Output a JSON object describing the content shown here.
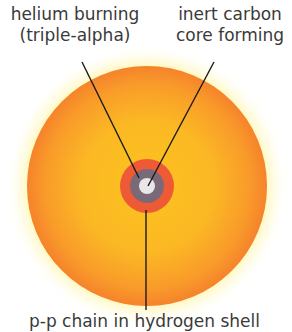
{
  "diagram": {
    "labels": {
      "helium": [
        "helium burning",
        "(triple-alpha)"
      ],
      "carbon": [
        "inert carbon",
        "core forming"
      ],
      "hydrogen": "p-p chain in hydrogen shell"
    },
    "star": {
      "cx": 147,
      "cy": 186,
      "r": 120,
      "color_outer": "#f7892a",
      "color_inner": "#fbbf22",
      "glow": "#fff6b0"
    },
    "core_layers": [
      {
        "name": "hydrogen-burning-shell",
        "r": 27,
        "color": "#ee5a36"
      },
      {
        "name": "helium-burning-shell",
        "r": 17,
        "color": "#7a6a78"
      },
      {
        "name": "carbon-core",
        "r": 8,
        "color": "#e8e6e6"
      }
    ],
    "leader_line_color": "#1a1a1a"
  }
}
